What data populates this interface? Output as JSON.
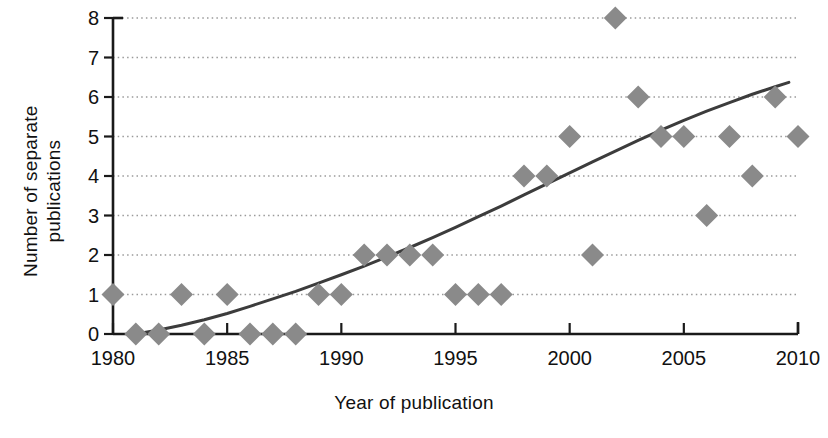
{
  "chart_data": {
    "type": "scatter",
    "title": "",
    "subtitle": "",
    "xlabel": "Year of publication",
    "ylabel": "Number of separate publications",
    "ylabel_lines": [
      "Number of separate",
      "publications"
    ],
    "xlim": [
      1980,
      2010
    ],
    "ylim": [
      0,
      8
    ],
    "xticks": [
      1980,
      1985,
      1990,
      1995,
      2000,
      2005,
      2010
    ],
    "xtick_labels": [
      "1980",
      "1985",
      "1990",
      "1995",
      "2000",
      "2005",
      "2010"
    ],
    "yticks": [
      0,
      1,
      2,
      3,
      4,
      5,
      6,
      7,
      8
    ],
    "ytick_labels": [
      "0",
      "1",
      "2",
      "3",
      "4",
      "5",
      "6",
      "7",
      "8"
    ],
    "grid": "horizontal-dotted",
    "legend": "none",
    "marker": "diamond",
    "marker_color": "#8a8a8a",
    "trend_color": "#3c3c3c",
    "axis_color": "#1a1a1a",
    "grid_color": "#9a9a9a",
    "x": [
      1980,
      1981,
      1982,
      1983,
      1984,
      1985,
      1986,
      1987,
      1988,
      1989,
      1990,
      1991,
      1992,
      1993,
      1994,
      1995,
      1996,
      1997,
      1998,
      1999,
      2000,
      2001,
      2002,
      2003,
      2004,
      2005,
      2006,
      2007,
      2008,
      2009,
      2010
    ],
    "values": [
      1,
      0,
      0,
      1,
      0,
      1,
      0,
      0,
      0,
      1,
      1,
      2,
      2,
      2,
      2,
      1,
      1,
      1,
      4,
      4,
      5,
      2,
      8,
      6,
      5,
      5,
      3,
      5,
      4,
      6,
      5
    ],
    "series": [
      {
        "name": "Publications per year",
        "points": [
          {
            "x": 1980,
            "y": 1
          },
          {
            "x": 1981,
            "y": 0
          },
          {
            "x": 1982,
            "y": 0
          },
          {
            "x": 1983,
            "y": 1
          },
          {
            "x": 1984,
            "y": 0
          },
          {
            "x": 1985,
            "y": 1
          },
          {
            "x": 1986,
            "y": 0
          },
          {
            "x": 1987,
            "y": 0
          },
          {
            "x": 1988,
            "y": 0
          },
          {
            "x": 1989,
            "y": 1
          },
          {
            "x": 1990,
            "y": 1
          },
          {
            "x": 1991,
            "y": 2
          },
          {
            "x": 1992,
            "y": 2
          },
          {
            "x": 1993,
            "y": 2
          },
          {
            "x": 1994,
            "y": 2
          },
          {
            "x": 1995,
            "y": 1
          },
          {
            "x": 1996,
            "y": 1
          },
          {
            "x": 1997,
            "y": 1
          },
          {
            "x": 1998,
            "y": 4
          },
          {
            "x": 1999,
            "y": 4
          },
          {
            "x": 2000,
            "y": 5
          },
          {
            "x": 2001,
            "y": 2
          },
          {
            "x": 2002,
            "y": 8
          },
          {
            "x": 2003,
            "y": 6
          },
          {
            "x": 2004,
            "y": 5
          },
          {
            "x": 2005,
            "y": 5
          },
          {
            "x": 2006,
            "y": 3
          },
          {
            "x": 2007,
            "y": 5
          },
          {
            "x": 2008,
            "y": 4
          },
          {
            "x": 2009,
            "y": 6
          },
          {
            "x": 2010,
            "y": 5
          }
        ]
      }
    ],
    "trendline": {
      "name": "Fitted trend",
      "style": "solid",
      "points": [
        {
          "x": 1981.0,
          "y": 0.0
        },
        {
          "x": 1982.0,
          "y": 0.1
        },
        {
          "x": 1983.0,
          "y": 0.22
        },
        {
          "x": 1984.0,
          "y": 0.36
        },
        {
          "x": 1985.0,
          "y": 0.52
        },
        {
          "x": 1986.0,
          "y": 0.7
        },
        {
          "x": 1987.0,
          "y": 0.89
        },
        {
          "x": 1988.0,
          "y": 1.08
        },
        {
          "x": 1989.0,
          "y": 1.29
        },
        {
          "x": 1990.0,
          "y": 1.5
        },
        {
          "x": 1991.0,
          "y": 1.72
        },
        {
          "x": 1992.0,
          "y": 1.95
        },
        {
          "x": 1993.0,
          "y": 2.19
        },
        {
          "x": 1994.0,
          "y": 2.44
        },
        {
          "x": 1995.0,
          "y": 2.7
        },
        {
          "x": 1996.0,
          "y": 2.97
        },
        {
          "x": 1997.0,
          "y": 3.24
        },
        {
          "x": 1998.0,
          "y": 3.52
        },
        {
          "x": 1999.0,
          "y": 3.8
        },
        {
          "x": 2000.0,
          "y": 4.08
        },
        {
          "x": 2001.0,
          "y": 4.36
        },
        {
          "x": 2002.0,
          "y": 4.63
        },
        {
          "x": 2003.0,
          "y": 4.9
        },
        {
          "x": 2004.0,
          "y": 5.16
        },
        {
          "x": 2005.0,
          "y": 5.41
        },
        {
          "x": 2006.0,
          "y": 5.64
        },
        {
          "x": 2007.0,
          "y": 5.86
        },
        {
          "x": 2008.0,
          "y": 6.07
        },
        {
          "x": 2009.0,
          "y": 6.26
        },
        {
          "x": 2009.6,
          "y": 6.37
        }
      ]
    }
  }
}
